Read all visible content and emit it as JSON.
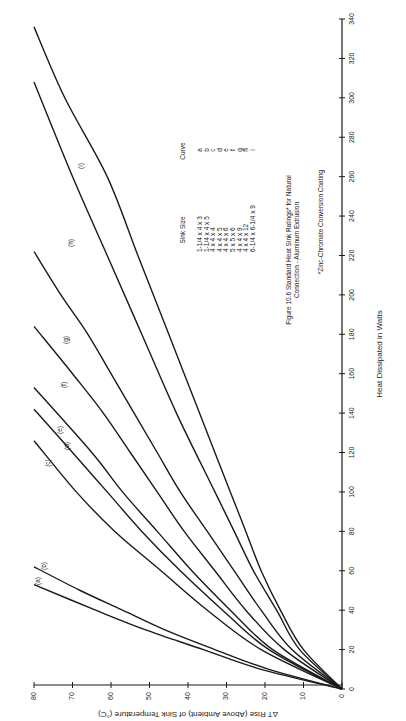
{
  "chart_data": {
    "type": "line",
    "footnote": "*Zinc-Chromate Conversion Coating",
    "xlabel": "Heat Dissipated in Watts",
    "ylabel": "ΔT Rise (Above Ambient) of Sink Temperature (°C)",
    "xlim": [
      0,
      340
    ],
    "ylim": [
      0,
      80
    ],
    "x_ticks": [
      0,
      20,
      40,
      60,
      80,
      100,
      120,
      140,
      160,
      180,
      200,
      220,
      240,
      260,
      280,
      300,
      320,
      340
    ],
    "y_ticks": [
      0,
      10,
      20,
      30,
      40,
      50,
      60,
      70,
      80
    ],
    "grid": false,
    "orientation": "rotated 90° counter-clockwise on page",
    "series": [
      {
        "name": "a",
        "sink_size": "1-1/4 x 4 x 3",
        "x": [
          0,
          10,
          20,
          30,
          40,
          53
        ],
        "y": [
          0,
          21,
          36,
          51,
          64,
          80
        ]
      },
      {
        "name": "b",
        "sink_size": "1-1/4 x 4 x 5",
        "x": [
          0,
          10,
          20,
          30,
          40,
          50,
          62
        ],
        "y": [
          0,
          19,
          33,
          46,
          57,
          68,
          80
        ]
      },
      {
        "name": "c",
        "sink_size": "4 x 4 x 4",
        "x": [
          0,
          20,
          40,
          60,
          80,
          100,
          126
        ],
        "y": [
          0,
          21,
          35,
          47,
          59,
          69,
          80
        ]
      },
      {
        "name": "d",
        "sink_size": "4 x 4 x 5",
        "x": [
          0,
          20,
          40,
          60,
          80,
          100,
          120,
          142
        ],
        "y": [
          0,
          19,
          31,
          42,
          52,
          61,
          70,
          80
        ]
      },
      {
        "name": "e",
        "sink_size": "4 x 4 x 6",
        "x": [
          0,
          20,
          40,
          60,
          80,
          100,
          120,
          153
        ],
        "y": [
          0,
          18,
          29,
          39,
          48,
          57,
          65,
          80
        ]
      },
      {
        "name": "f",
        "sink_size": "5 x 5 x 6",
        "x": [
          0,
          20,
          40,
          60,
          80,
          100,
          120,
          140,
          160,
          184
        ],
        "y": [
          0,
          15,
          25,
          33,
          41,
          48,
          55,
          62,
          70,
          80
        ]
      },
      {
        "name": "g",
        "sink_size": "4 x 4 x 9",
        "x": [
          0,
          20,
          40,
          60,
          80,
          100,
          120,
          140,
          160,
          180,
          200,
          222
        ],
        "y": [
          0,
          13,
          21,
          28,
          35,
          42,
          48,
          54,
          60,
          66,
          73,
          80
        ]
      },
      {
        "name": "h",
        "sink_size": "4 x 4 x 12",
        "x": [
          0,
          20,
          40,
          60,
          80,
          100,
          140,
          180,
          220,
          260,
          308
        ],
        "y": [
          0,
          11,
          17,
          23,
          28,
          33,
          43,
          52,
          61,
          70,
          80
        ]
      },
      {
        "name": "i",
        "sink_size": "6-1/4 x 6-1/4 x 9",
        "x": [
          0,
          20,
          40,
          60,
          80,
          100,
          140,
          180,
          220,
          260,
          300,
          336
        ],
        "y": [
          0,
          10,
          16,
          21,
          25,
          29,
          37,
          45,
          53,
          61,
          72,
          80
        ]
      }
    ]
  },
  "legend": {
    "header_size": "Sink Size",
    "header_curve": "Curve",
    "rows": [
      {
        "size": "1-1/4 x 4 x 3",
        "curve": "a"
      },
      {
        "size": "1-1/4 x 4 x 5",
        "curve": "b"
      },
      {
        "size": "4 x 4 x 4",
        "curve": "c"
      },
      {
        "size": "4 x 4 x 5",
        "curve": "d"
      },
      {
        "size": "4 x 4 x 6",
        "curve": "e"
      },
      {
        "size": "5 x 5 x 6",
        "curve": "f"
      },
      {
        "size": "4 x 4 x 9",
        "curve": "g"
      },
      {
        "size": "4 x 4 x 12",
        "curve": "h"
      },
      {
        "size": "6-1/4 x 6-1/4 x 9",
        "curve": "i"
      }
    ]
  },
  "caption": {
    "line1": "Figure 10.6  Standard Heat Sink Ratings* for Natural",
    "line2": "Connection - Aluminum Extrusion",
    "footnote": "*Zinc-Chromate Conversion Coating"
  },
  "axes": {
    "x_title": "Heat Dissipated in Watts",
    "y_title": "ΔT Rise (Above Ambient) of Sink Temperature (°C)"
  },
  "colors": {
    "ink": "#1a1a1a",
    "paper": "#ffffff"
  }
}
